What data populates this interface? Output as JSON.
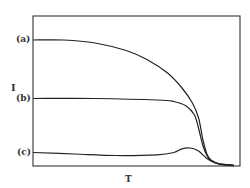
{
  "chart_data": {
    "type": "line",
    "title": "",
    "xlabel": "T",
    "ylabel": "I",
    "grid": false,
    "legend": "inline labels on y-axis",
    "xlim": [
      0,
      1
    ],
    "ylim": [
      0,
      1
    ],
    "series": [
      {
        "name": "(a)",
        "x": [
          0.0,
          0.15,
          0.3,
          0.45,
          0.55,
          0.65,
          0.72,
          0.77,
          0.8,
          0.82,
          0.84,
          0.86,
          0.9,
          0.97
        ],
        "y": [
          0.84,
          0.84,
          0.82,
          0.77,
          0.71,
          0.62,
          0.52,
          0.42,
          0.32,
          0.18,
          0.08,
          0.04,
          0.015,
          0.005
        ]
      },
      {
        "name": "(b)",
        "x": [
          0.0,
          0.3,
          0.6,
          0.68,
          0.74,
          0.78,
          0.8,
          0.82,
          0.84,
          0.86,
          0.9,
          0.97
        ],
        "y": [
          0.45,
          0.45,
          0.44,
          0.43,
          0.4,
          0.34,
          0.25,
          0.14,
          0.07,
          0.035,
          0.015,
          0.005
        ]
      },
      {
        "name": "(c)",
        "x": [
          0.0,
          0.2,
          0.4,
          0.6,
          0.68,
          0.72,
          0.76,
          0.8,
          0.84,
          0.88,
          0.92,
          0.97
        ],
        "y": [
          0.09,
          0.08,
          0.07,
          0.075,
          0.09,
          0.115,
          0.12,
          0.1,
          0.05,
          0.02,
          0.008,
          0.003
        ]
      }
    ]
  },
  "labels": {
    "y_axis": "I",
    "x_axis": "T",
    "a": "(a)",
    "b": "(b)",
    "c": "(c)"
  }
}
